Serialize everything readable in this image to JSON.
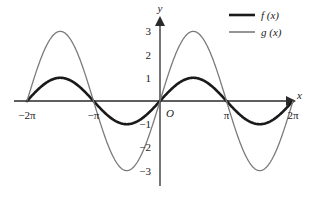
{
  "chart_data": {
    "type": "line",
    "title": "",
    "xlabel": "x",
    "ylabel": "y",
    "origin_label": "O",
    "grid": false,
    "legend_position": "top-right",
    "xlim": [
      -6.283185307,
      6.283185307
    ],
    "ylim": [
      -3.6,
      3.6
    ],
    "x_ticks": [
      {
        "value": -6.283185307,
        "label": "−2π"
      },
      {
        "value": -3.141592653,
        "label": "−π"
      },
      {
        "value": 3.141592653,
        "label": "π"
      },
      {
        "value": 6.283185307,
        "label": "2π"
      }
    ],
    "y_ticks": [
      {
        "value": 3,
        "label": "3"
      },
      {
        "value": 2,
        "label": "2"
      },
      {
        "value": 1,
        "label": "1"
      },
      {
        "value": -1,
        "label": "−1"
      },
      {
        "value": -2,
        "label": "−2"
      },
      {
        "value": -3,
        "label": "−3"
      }
    ],
    "series": [
      {
        "name": "f (x)",
        "legend_label": "f (x)",
        "color": "#1a1a1a",
        "width": 2.6,
        "amplitude": 1,
        "period": 6.283185307,
        "formula": "sin(x)",
        "x": [
          -6.2832,
          -5.8905,
          -5.4978,
          -5.1051,
          -4.7124,
          -4.3197,
          -3.927,
          -3.5343,
          -3.1416,
          -2.7489,
          -2.3562,
          -1.9635,
          -1.5708,
          -1.1781,
          -0.7854,
          -0.3927,
          0,
          0.3927,
          0.7854,
          1.1781,
          1.5708,
          1.9635,
          2.3562,
          2.7489,
          3.1416,
          3.5343,
          3.927,
          4.3197,
          4.7124,
          5.1051,
          5.4978,
          5.8905,
          6.2832
        ],
        "values": [
          0,
          0.3827,
          0.7071,
          0.9239,
          1,
          0.9239,
          0.7071,
          0.3827,
          0,
          -0.3827,
          -0.7071,
          -0.9239,
          -1,
          -0.9239,
          -0.7071,
          -0.3827,
          0,
          0.3827,
          0.7071,
          0.9239,
          1,
          0.9239,
          0.7071,
          0.3827,
          0,
          -0.3827,
          -0.7071,
          -0.9239,
          -1,
          -0.9239,
          -0.7071,
          -0.3827,
          0
        ]
      },
      {
        "name": "g (x)",
        "legend_label": "g (x)",
        "color": "#7a7a7a",
        "width": 1.3,
        "amplitude": 3,
        "period": 6.283185307,
        "formula": "3 sin(x)",
        "x": [
          -6.2832,
          -5.8905,
          -5.4978,
          -5.1051,
          -4.7124,
          -4.3197,
          -3.927,
          -3.5343,
          -3.1416,
          -2.7489,
          -2.3562,
          -1.9635,
          -1.5708,
          -1.1781,
          -0.7854,
          -0.3927,
          0,
          0.3927,
          0.7854,
          1.1781,
          1.5708,
          1.9635,
          2.3562,
          2.7489,
          3.1416,
          3.5343,
          3.927,
          4.3197,
          4.7124,
          5.1051,
          5.4978,
          5.8905,
          6.2832
        ],
        "values": [
          0,
          1.1481,
          2.1213,
          2.7716,
          3,
          2.7716,
          2.1213,
          1.1481,
          0,
          -1.1481,
          -2.1213,
          -2.7716,
          -3,
          -2.7716,
          -2.1213,
          -1.1481,
          0,
          1.1481,
          2.1213,
          2.7716,
          3,
          2.7716,
          2.1213,
          1.1481,
          0,
          -1.1481,
          -2.1213,
          -2.7716,
          -3,
          -2.7716,
          -2.1213,
          -1.1481,
          0
        ]
      }
    ]
  },
  "colors": {
    "axis": "#2a2a2a",
    "f_curve": "#1a1a1a",
    "g_curve": "#7a7a7a",
    "background": "#ffffff"
  }
}
